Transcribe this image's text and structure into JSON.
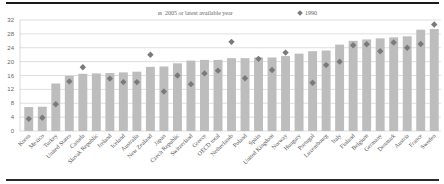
{
  "chart_data": {
    "type": "bar",
    "title": "",
    "xlabel": "",
    "ylabel": "",
    "ylim": [
      0,
      32
    ],
    "yticks": [
      0,
      4,
      8,
      12,
      16,
      20,
      24,
      28,
      32
    ],
    "grid": true,
    "legend_position": "top",
    "categories": [
      "Korea",
      "Mexico",
      "Turkey",
      "United States",
      "Canada",
      "Slovak Republic",
      "Ireland",
      "Iceland",
      "Australia",
      "New Zealand",
      "Japan",
      "Czech Republic",
      "Switzerland",
      "Greece",
      "OECD total",
      "Netherlands",
      "Poland",
      "Spain",
      "United Kingdom",
      "Norway",
      "Hungary",
      "Portugal",
      "Luxembourg",
      "Italy",
      "Finland",
      "Belgium",
      "Germany",
      "Denmark",
      "Austria",
      "France",
      "Sweden"
    ],
    "series": [
      {
        "name": "2005 or latest available year",
        "type": "bar",
        "color": "#bdbdbd",
        "values": [
          6.9,
          7.0,
          13.7,
          15.9,
          16.5,
          16.6,
          16.7,
          16.9,
          17.1,
          18.5,
          18.6,
          19.5,
          20.3,
          20.5,
          20.5,
          21.0,
          21.0,
          21.2,
          21.2,
          21.6,
          22.3,
          23.0,
          23.2,
          24.9,
          26.0,
          26.4,
          26.7,
          27.0,
          27.3,
          29.2,
          29.4
        ]
      },
      {
        "name": "1990",
        "type": "marker",
        "marker": "diamond",
        "color": "#7a7a7a",
        "values": [
          3.5,
          3.8,
          7.7,
          14.3,
          18.4,
          null,
          15.1,
          14.1,
          14.1,
          22.0,
          11.4,
          16.0,
          13.5,
          16.6,
          17.4,
          25.7,
          15.2,
          20.8,
          17.6,
          22.6,
          null,
          13.9,
          19.0,
          20.0,
          24.7,
          25.0,
          23.0,
          25.5,
          24.0,
          25.1,
          30.7
        ]
      }
    ]
  },
  "legend": {
    "bar_label": "2005 or latest available year",
    "marker_label": "1990"
  }
}
